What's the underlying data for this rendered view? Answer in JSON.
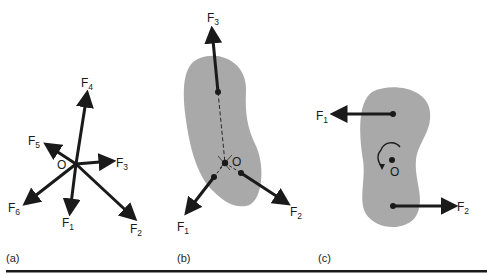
{
  "figure": {
    "colors": {
      "ink": "#1a1a1a",
      "body_fill": "#a9a9a9",
      "background": "#ffffff"
    },
    "panels": [
      {
        "id": "a",
        "caption": "(a)",
        "origin_label": "O",
        "forces": [
          {
            "name": "F",
            "sub": "1"
          },
          {
            "name": "F",
            "sub": "2"
          },
          {
            "name": "F",
            "sub": "3"
          },
          {
            "name": "F",
            "sub": "4"
          },
          {
            "name": "F",
            "sub": "5"
          },
          {
            "name": "F",
            "sub": "6"
          }
        ]
      },
      {
        "id": "b",
        "caption": "(b)",
        "origin_label": "O",
        "forces": [
          {
            "name": "F",
            "sub": "1"
          },
          {
            "name": "F",
            "sub": "2"
          },
          {
            "name": "F",
            "sub": "3"
          }
        ]
      },
      {
        "id": "c",
        "caption": "(c)",
        "origin_label": "O",
        "forces": [
          {
            "name": "F",
            "sub": "1"
          },
          {
            "name": "F",
            "sub": "2"
          }
        ]
      }
    ]
  }
}
